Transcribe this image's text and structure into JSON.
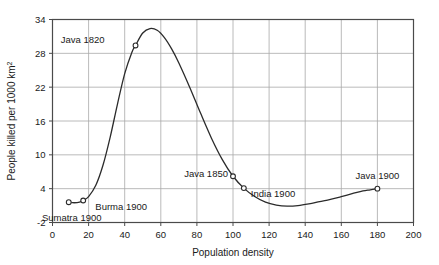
{
  "chart_data": {
    "type": "line",
    "title": "",
    "xlabel": "Population density",
    "ylabel": "People killed per 1000 km",
    "ylabel_superscript": "2",
    "xlim": [
      0,
      200
    ],
    "ylim": [
      -2,
      34
    ],
    "xticks": [
      0,
      20,
      40,
      60,
      80,
      100,
      120,
      140,
      160,
      180,
      200
    ],
    "yticks": [
      -2,
      4,
      10,
      16,
      22,
      28,
      34
    ],
    "xtick_labels": [
      "0",
      "20",
      "40",
      "60",
      "80",
      "100",
      "120",
      "140",
      "160",
      "180",
      "200"
    ],
    "ytick_labels": [
      "-2",
      "4",
      "10",
      "16",
      "22",
      "28",
      "34"
    ],
    "grid": true,
    "grid_color": "#a8a8a8",
    "frame_color": "#4a4a4a",
    "line_color": "#2b2b2b",
    "marker_color": "#2b2b2b",
    "legend": "none",
    "series": [
      {
        "name": "People killed per 1000 km2 vs population density",
        "x": [
          9,
          12,
          15,
          17,
          20,
          24,
          28,
          32,
          36,
          40,
          44,
          46,
          50,
          54,
          58,
          62,
          66,
          70,
          76,
          82,
          88,
          94,
          100,
          106,
          112,
          118,
          124,
          130,
          136,
          142,
          148,
          154,
          160,
          166,
          172,
          176,
          180
        ],
        "y": [
          1.6,
          1.5,
          1.6,
          1.9,
          2.6,
          4.6,
          8.2,
          13.2,
          19.0,
          24.4,
          28.2,
          29.4,
          31.6,
          32.4,
          32.1,
          30.8,
          28.8,
          26.3,
          22.0,
          17.4,
          13.0,
          9.2,
          6.2,
          4.1,
          2.6,
          1.6,
          1.1,
          0.9,
          1.0,
          1.3,
          1.7,
          2.1,
          2.6,
          3.1,
          3.6,
          3.8,
          4.0
        ]
      }
    ],
    "points": [
      {
        "label": "Sumatra 1900",
        "x": 9,
        "y": 1.6,
        "label_dx": 3,
        "label_dy": 19,
        "anchor": "middle"
      },
      {
        "label": "Burma 1900",
        "x": 17,
        "y": 1.9,
        "label_dx": 38,
        "label_dy": 9,
        "anchor": "middle"
      },
      {
        "label": "Java 1820",
        "x": 46,
        "y": 29.4,
        "label_dx": -31,
        "label_dy": -2,
        "anchor": "end"
      },
      {
        "label": "Java 1850",
        "x": 100,
        "y": 6.2,
        "label_dx": -5,
        "label_dy": 1,
        "anchor": "end"
      },
      {
        "label": "India 1900",
        "x": 106,
        "y": 4.1,
        "label_dx": 7,
        "label_dy": 9,
        "anchor": "start"
      },
      {
        "label": "Java 1900",
        "x": 180,
        "y": 4.0,
        "label_dx": 0,
        "label_dy": -10,
        "anchor": "middle"
      }
    ]
  }
}
